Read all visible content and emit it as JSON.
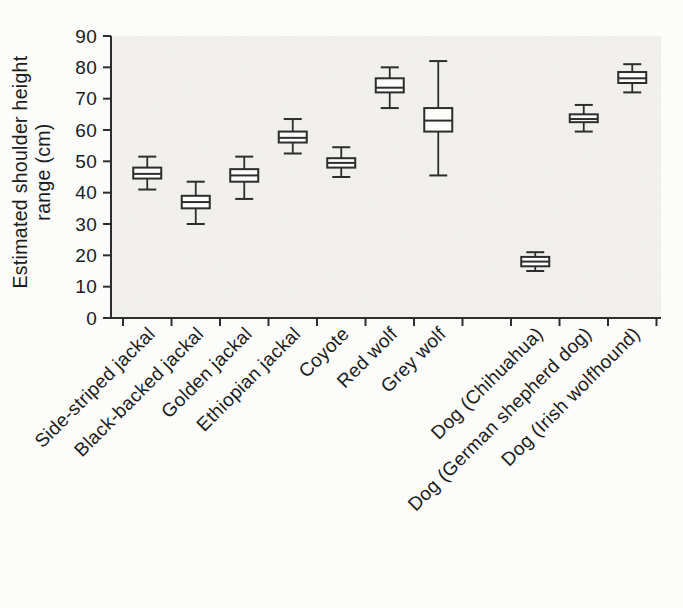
{
  "figure": {
    "background": "#fcfcfb",
    "panel_background": "#f2f1ee",
    "line_color": "#2d2d2d",
    "box_fill": "#fdfdfc",
    "text_color": "#1b1b1b"
  },
  "chart_data": {
    "type": "boxplot",
    "title": "",
    "xlabel": "",
    "ylabel_lines": [
      "Estimated shoulder height",
      "range (cm)"
    ],
    "ylabel": "Estimated shoulder height range (cm)",
    "ylim": [
      0,
      90
    ],
    "yticks": [
      0,
      10,
      20,
      30,
      40,
      50,
      60,
      70,
      80,
      90
    ],
    "grid": false,
    "legend": false,
    "n_slots": 11,
    "categories": [
      "Side-striped jackal",
      "Black-backed jackal",
      "Golden jackal",
      "Ethiopian jackal",
      "Coyote",
      "Red wolf",
      "Grey wolf",
      "Dog (Chihuahua)",
      "Dog (German shepherd dog)",
      "Dog (Irish wolfhound)"
    ],
    "series": [
      {
        "name": "Side-striped jackal",
        "slot": 0,
        "whisker_low": 41,
        "q1": 44.5,
        "median": 46,
        "q3": 48,
        "whisker_high": 51.5
      },
      {
        "name": "Black-backed jackal",
        "slot": 1,
        "whisker_low": 30,
        "q1": 35,
        "median": 37,
        "q3": 39,
        "whisker_high": 43.5
      },
      {
        "name": "Golden jackal",
        "slot": 2,
        "whisker_low": 38,
        "q1": 43.5,
        "median": 45.5,
        "q3": 47.5,
        "whisker_high": 51.5
      },
      {
        "name": "Ethiopian jackal",
        "slot": 3,
        "whisker_low": 52.5,
        "q1": 56,
        "median": 57.5,
        "q3": 59.5,
        "whisker_high": 63.5
      },
      {
        "name": "Coyote",
        "slot": 4,
        "whisker_low": 45,
        "q1": 48,
        "median": 49.5,
        "q3": 51,
        "whisker_high": 54.5
      },
      {
        "name": "Red wolf",
        "slot": 5,
        "whisker_low": 67,
        "q1": 72,
        "median": 73.5,
        "q3": 76.5,
        "whisker_high": 80
      },
      {
        "name": "Grey wolf",
        "slot": 6,
        "whisker_low": 45.5,
        "q1": 59.5,
        "median": 63,
        "q3": 67,
        "whisker_high": 82
      },
      {
        "name": "Dog (Chihuahua)",
        "slot": 8,
        "whisker_low": 15,
        "q1": 16.5,
        "median": 18,
        "q3": 19.5,
        "whisker_high": 21
      },
      {
        "name": "Dog (German shepherd dog)",
        "slot": 9,
        "whisker_low": 59.5,
        "q1": 62.5,
        "median": 63.5,
        "q3": 65,
        "whisker_high": 68
      },
      {
        "name": "Dog (Irish wolfhound)",
        "slot": 10,
        "whisker_low": 72,
        "q1": 75,
        "median": 76.5,
        "q3": 78.5,
        "whisker_high": 81
      }
    ]
  }
}
